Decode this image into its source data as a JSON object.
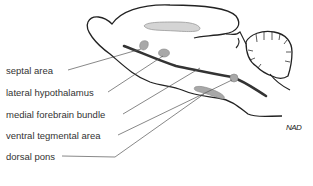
{
  "diagram": {
    "colors": {
      "outline": "#222222",
      "region_fill": "#a8a8a8",
      "structure_fill": "#d4d4d4",
      "leader_line": "#555555",
      "label_text": "#333333"
    },
    "labels": [
      {
        "id": "septal-area",
        "text": "septal area",
        "y": 70
      },
      {
        "id": "lateral-hypothalamus",
        "text": "lateral hypothalamus",
        "y": 92
      },
      {
        "id": "medial-forebrain-bundle",
        "text": "medial forebrain bundle",
        "y": 114
      },
      {
        "id": "ventral-tegmental-area",
        "text": "ventral tegmental area",
        "y": 135
      },
      {
        "id": "dorsal-pons",
        "text": "dorsal pons",
        "y": 156
      }
    ],
    "signature": "NAD"
  }
}
